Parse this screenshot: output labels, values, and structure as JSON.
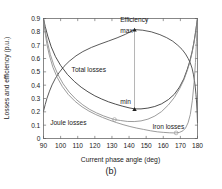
{
  "figure": {
    "caption": "(b)"
  },
  "chart_data": {
    "type": "line",
    "title": "",
    "xlabel": "Current phase angle (deg)",
    "ylabel": "Losses and efficiency (p.u.)",
    "xlim": [
      90,
      180
    ],
    "ylim": [
      0,
      0.9
    ],
    "grid": false,
    "legend_position": "inline-annotations",
    "xticks": [
      90,
      100,
      110,
      120,
      130,
      140,
      150,
      160,
      170,
      180
    ],
    "xticklabels": [
      "90",
      "100",
      "110",
      "120",
      "130",
      "140",
      "150",
      "160",
      "170",
      "180"
    ],
    "yticks": [
      0,
      0.1,
      0.2,
      0.3,
      0.4,
      0.5,
      0.6,
      0.7,
      0.8,
      0.9
    ],
    "yticklabels": [
      "0",
      "0.1",
      "0.2",
      "0.3",
      "0.4",
      "0.5",
      "0.6",
      "0.7",
      "0.8",
      "0.9"
    ],
    "annotations": [
      {
        "name": "efficiency-label",
        "text": "Efficiency",
        "x": 143.0,
        "y": 0.875
      },
      {
        "name": "max-label",
        "text": "max",
        "x": 138.5,
        "y": 0.795
      },
      {
        "name": "total-losses-label",
        "text": "Total losses",
        "x": 116.5,
        "y": 0.5
      },
      {
        "name": "min-label",
        "text": "min",
        "x": 138.0,
        "y": 0.262
      },
      {
        "name": "joule-losses-label",
        "text": "Joule losses",
        "x": 104.5,
        "y": 0.105
      },
      {
        "name": "iron-losses-label",
        "text": "Iron losses",
        "x": 163.0,
        "y": 0.075
      }
    ],
    "markers": [
      {
        "name": "efficiency-max-marker",
        "symbol": "triangle",
        "x": 143.2,
        "y": 0.817
      },
      {
        "name": "total-losses-min-marker",
        "symbol": "triangle",
        "x": 143.2,
        "y": 0.222
      },
      {
        "name": "joule-losses-marker",
        "symbol": "circle",
        "x": 131.5,
        "y": 0.142
      },
      {
        "name": "iron-losses-marker",
        "symbol": "circle",
        "x": 167.5,
        "y": 0.042
      }
    ],
    "leader_line": {
      "name": "max-min-connector",
      "x": 143.2,
      "y_top": 0.817,
      "y_bottom": 0.222
    },
    "series": [
      {
        "name": "Efficiency",
        "color": "#3c3c3c",
        "x": [
          90.0,
          91.0,
          92.0,
          93.5,
          95.0,
          97.0,
          99.0,
          102.0,
          105.0,
          109.0,
          113.0,
          118.0,
          123.0,
          128.0,
          133.0,
          138.0,
          143.2,
          148.0,
          153.0,
          158.0,
          162.0,
          165.5,
          168.5,
          171.0,
          173.0,
          174.5,
          175.8,
          176.8,
          177.6,
          178.2,
          178.7,
          179.1,
          179.5,
          179.8,
          180.0
        ],
        "y": [
          0.205,
          0.255,
          0.3,
          0.355,
          0.402,
          0.452,
          0.492,
          0.541,
          0.579,
          0.62,
          0.652,
          0.683,
          0.708,
          0.731,
          0.755,
          0.782,
          0.817,
          0.812,
          0.8,
          0.779,
          0.756,
          0.73,
          0.699,
          0.668,
          0.634,
          0.601,
          0.566,
          0.528,
          0.482,
          0.436,
          0.386,
          0.331,
          0.266,
          0.192,
          0.12
        ]
      },
      {
        "name": "Total losses",
        "color": "#2e2e2e",
        "x": [
          90.0,
          91.0,
          92.5,
          94.5,
          97.0,
          100.0,
          104.0,
          108.0,
          112.0,
          116.0,
          120.0,
          124.0,
          128.0,
          132.0,
          136.0,
          140.0,
          143.2,
          147.0,
          151.0,
          155.0,
          159.0,
          163.0,
          166.5,
          169.5,
          172.0,
          174.0,
          175.5,
          176.8,
          177.8,
          178.6,
          179.2,
          179.6,
          180.0
        ],
        "y": [
          0.9,
          0.84,
          0.768,
          0.688,
          0.614,
          0.548,
          0.48,
          0.428,
          0.385,
          0.35,
          0.32,
          0.296,
          0.275,
          0.258,
          0.243,
          0.23,
          0.222,
          0.222,
          0.228,
          0.24,
          0.26,
          0.292,
          0.332,
          0.386,
          0.448,
          0.518,
          0.58,
          0.648,
          0.714,
          0.776,
          0.828,
          0.868,
          0.9
        ]
      },
      {
        "name": "Joule losses",
        "color": "#8a8a8a",
        "x": [
          90.0,
          90.6,
          91.4,
          92.5,
          94.0,
          96.0,
          98.5,
          101.5,
          105.0,
          109.0,
          113.0,
          117.0,
          121.0,
          125.0,
          129.0,
          131.5,
          135.0,
          139.0,
          143.0,
          147.0,
          151.0,
          155.0,
          159.0,
          163.0,
          166.5,
          169.5,
          172.0,
          174.0,
          175.6,
          177.0,
          178.0,
          178.8,
          179.4,
          180.0
        ],
        "y": [
          0.9,
          0.845,
          0.782,
          0.712,
          0.63,
          0.552,
          0.478,
          0.41,
          0.348,
          0.294,
          0.252,
          0.218,
          0.192,
          0.17,
          0.152,
          0.142,
          0.135,
          0.128,
          0.127,
          0.132,
          0.145,
          0.168,
          0.202,
          0.252,
          0.308,
          0.372,
          0.438,
          0.508,
          0.576,
          0.654,
          0.722,
          0.788,
          0.846,
          0.9
        ]
      },
      {
        "name": "Iron losses",
        "color": "#8a8a8a",
        "x": [
          90.0,
          90.5,
          91.2,
          92.2,
          93.5,
          95.5,
          98.0,
          101.0,
          104.5,
          108.5,
          112.5,
          116.5,
          120.5,
          124.5,
          128.5,
          132.5,
          136.5,
          140.5,
          144.5,
          148.5,
          152.5,
          156.5,
          160.0,
          163.5,
          166.0,
          167.5,
          169.5,
          171.5,
          173.0,
          174.5,
          175.8,
          177.0,
          178.0,
          178.8,
          179.4,
          180.0
        ],
        "y": [
          0.9,
          0.838,
          0.77,
          0.694,
          0.62,
          0.534,
          0.458,
          0.39,
          0.33,
          0.278,
          0.238,
          0.206,
          0.18,
          0.158,
          0.138,
          0.12,
          0.104,
          0.09,
          0.078,
          0.068,
          0.058,
          0.05,
          0.046,
          0.043,
          0.042,
          0.042,
          0.046,
          0.058,
          0.078,
          0.118,
          0.18,
          0.286,
          0.42,
          0.57,
          0.73,
          0.9
        ]
      }
    ]
  }
}
